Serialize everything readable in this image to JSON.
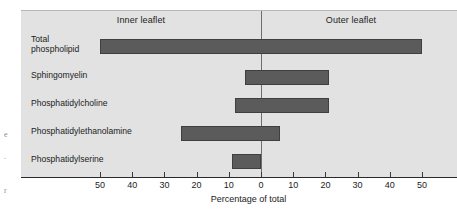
{
  "figure": {
    "panel_labels": {
      "inner": "Inner leaflet",
      "outer": "Outer leaflet"
    },
    "colors": {
      "bar": "#5b5b5b",
      "bar_border": "#3f3f3f",
      "panel_background": "#e2e2e2",
      "axis": "#2a2a2a",
      "zero_line": "#6d6d6d"
    },
    "margin_marks": [
      "e",
      ".",
      "r"
    ]
  },
  "chart_data": {
    "type": "bar",
    "orientation": "horizontal",
    "title": "",
    "subtitle": "",
    "xlabel": "Percentage of total",
    "ylabel": "",
    "xlim": [
      -55,
      55
    ],
    "grid": false,
    "legend": null,
    "annotations": [
      {
        "text": "Inner leaflet",
        "x": -27,
        "note": "panel header, left of zero line"
      },
      {
        "text": "Outer leaflet",
        "x": 27,
        "note": "panel header, right of zero line"
      }
    ],
    "axis_note": "X axis is mirrored: values increase outward from 0 in both directions; left side = inner leaflet, right side = outer leaflet.",
    "xticks": [
      -50,
      -40,
      -30,
      -20,
      -10,
      0,
      10,
      20,
      30,
      40,
      50
    ],
    "xticklabels": [
      "50",
      "40",
      "30",
      "20",
      "10",
      "0",
      "10",
      "20",
      "30",
      "40",
      "50"
    ],
    "categories": [
      "Total phospholipid",
      "Sphingomyelin",
      "Phosphatidylcholine",
      "Phosphatidylethanolamine",
      "Phosphatidylserine"
    ],
    "series": [
      {
        "name": "Inner leaflet",
        "values": [
          50,
          5,
          8,
          25,
          9
        ]
      },
      {
        "name": "Outer leaflet",
        "values": [
          50,
          21,
          21,
          6,
          0
        ]
      }
    ],
    "bars": [
      {
        "category": "Total phospholipid",
        "label_lines": [
          "Total",
          "phospholipid"
        ],
        "inner": 50,
        "outer": 50
      },
      {
        "category": "Sphingomyelin",
        "label_lines": [
          "Sphingomyelin"
        ],
        "inner": 5,
        "outer": 21
      },
      {
        "category": "Phosphatidylcholine",
        "label_lines": [
          "Phosphatidylcholine"
        ],
        "inner": 8,
        "outer": 21
      },
      {
        "category": "Phosphatidylethanolamine",
        "label_lines": [
          "Phosphatidylethanolamine"
        ],
        "inner": 25,
        "outer": 6
      },
      {
        "category": "Phosphatidylserine",
        "label_lines": [
          "Phosphatidylserine"
        ],
        "inner": 9,
        "outer": 0
      }
    ]
  }
}
